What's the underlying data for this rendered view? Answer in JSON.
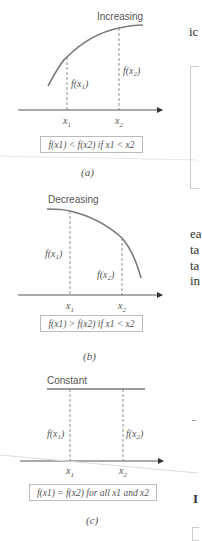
{
  "figure": {
    "panels": [
      {
        "id": "a",
        "title": "Increasing",
        "f_x1_label": "f(x1)",
        "f_x2_label": "f(x2)",
        "x1_label": "x1",
        "x2_label": "x2",
        "condition": "f(x1) < f(x2) if x1 < x2",
        "caption": "(a)"
      },
      {
        "id": "b",
        "title": "Decreasing",
        "f_x1_label": "f(x1)",
        "f_x2_label": "f(x2)",
        "x1_label": "x1",
        "x2_label": "x2",
        "condition": "f(x1) > f(x2) if x1 < x2",
        "caption": "(b)"
      },
      {
        "id": "c",
        "title": "Constant",
        "f_x1_label": "f(x1)",
        "f_x2_label": "f(x2)",
        "x1_label": "x1",
        "x2_label": "x2",
        "condition": "f(x1) = f(x2) for all x1 and x2",
        "caption": "(c)"
      }
    ]
  },
  "right_column_fragments": [
    "ic",
    "ea",
    "ta",
    "ta",
    "in",
    "I"
  ],
  "colors": {
    "curve": "#7a7a7a",
    "axis": "#555555",
    "box_border": "#bbbbbb",
    "text": "#555555"
  }
}
